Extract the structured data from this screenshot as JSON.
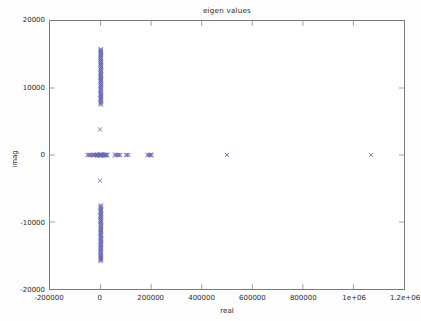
{
  "chart_data": {
    "type": "scatter",
    "title": "eigen values",
    "xlabel": "real",
    "ylabel": "imag",
    "xlim": [
      -200000,
      1200000
    ],
    "ylim": [
      -20000,
      20000
    ],
    "grid": false,
    "legend": null,
    "marker": {
      "symbol": "x",
      "color": "#6a6ab4",
      "size": 4.2
    },
    "xticks": [
      -200000,
      0,
      200000,
      400000,
      600000,
      800000,
      1000000,
      1200000
    ],
    "xticklabels": [
      "-200000",
      "0",
      "200000",
      "400000",
      "600000",
      "800000",
      "1e+06",
      "1.2e+06"
    ],
    "yticks": [
      20000,
      10000,
      0,
      -10000,
      -20000
    ],
    "yticklabels": [
      "20000",
      "10000",
      "0",
      "-10000",
      "-20000"
    ],
    "series": [
      {
        "name": "eigenvalues",
        "points": [
          [
            500,
            15820
          ],
          [
            1400,
            15700
          ],
          [
            -200,
            15600
          ],
          [
            900,
            15480
          ],
          [
            2100,
            15350
          ],
          [
            300,
            15230
          ],
          [
            1700,
            15100
          ],
          [
            -600,
            14980
          ],
          [
            1100,
            14850
          ],
          [
            2400,
            14720
          ],
          [
            0,
            14600
          ],
          [
            800,
            14470
          ],
          [
            1900,
            14350
          ],
          [
            -400,
            14220
          ],
          [
            1300,
            14100
          ],
          [
            600,
            13970
          ],
          [
            2200,
            13840
          ],
          [
            100,
            13720
          ],
          [
            1500,
            13590
          ],
          [
            -300,
            13470
          ],
          [
            1000,
            13340
          ],
          [
            2600,
            13210
          ],
          [
            400,
            13090
          ],
          [
            1800,
            12960
          ],
          [
            -100,
            12830
          ],
          [
            1200,
            12710
          ],
          [
            2300,
            12580
          ],
          [
            700,
            12450
          ],
          [
            1600,
            12330
          ],
          [
            -500,
            12200
          ],
          [
            1100,
            12070
          ],
          [
            2500,
            11950
          ],
          [
            200,
            11820
          ],
          [
            1400,
            11690
          ],
          [
            -200,
            11570
          ],
          [
            900,
            11440
          ],
          [
            2000,
            11310
          ],
          [
            500,
            11190
          ],
          [
            1700,
            11060
          ],
          [
            0,
            10930
          ],
          [
            1300,
            10810
          ],
          [
            2700,
            10680
          ],
          [
            600,
            10550
          ],
          [
            1900,
            10430
          ],
          [
            -400,
            10300
          ],
          [
            1000,
            10170
          ],
          [
            2200,
            10050
          ],
          [
            300,
            9920
          ],
          [
            1500,
            9790
          ],
          [
            -700,
            9670
          ],
          [
            1100,
            9540
          ],
          [
            2400,
            9410
          ],
          [
            400,
            9290
          ],
          [
            1800,
            9160
          ],
          [
            -100,
            9030
          ],
          [
            1200,
            8900
          ],
          [
            2100,
            8780
          ],
          [
            700,
            8650
          ],
          [
            1600,
            8520
          ],
          [
            -500,
            8400
          ],
          [
            1000,
            8270
          ],
          [
            2300,
            8140
          ],
          [
            200,
            8020
          ],
          [
            1400,
            7890
          ],
          [
            -300,
            7760
          ],
          [
            900,
            7640
          ],
          [
            1900,
            7510
          ],
          [
            -1800,
            3820
          ],
          [
            500,
            -15820
          ],
          [
            1400,
            -15700
          ],
          [
            -200,
            -15600
          ],
          [
            900,
            -15480
          ],
          [
            2100,
            -15350
          ],
          [
            300,
            -15230
          ],
          [
            1700,
            -15100
          ],
          [
            -600,
            -14980
          ],
          [
            1100,
            -14850
          ],
          [
            2400,
            -14720
          ],
          [
            0,
            -14600
          ],
          [
            800,
            -14470
          ],
          [
            1900,
            -14350
          ],
          [
            -400,
            -14220
          ],
          [
            1300,
            -14100
          ],
          [
            600,
            -13970
          ],
          [
            2200,
            -13840
          ],
          [
            100,
            -13720
          ],
          [
            1500,
            -13590
          ],
          [
            -300,
            -13470
          ],
          [
            1000,
            -13340
          ],
          [
            2600,
            -13210
          ],
          [
            400,
            -13090
          ],
          [
            1800,
            -12960
          ],
          [
            -100,
            -12830
          ],
          [
            1200,
            -12710
          ],
          [
            2300,
            -12580
          ],
          [
            700,
            -12450
          ],
          [
            1600,
            -12330
          ],
          [
            -500,
            -12200
          ],
          [
            1100,
            -12070
          ],
          [
            2500,
            -11950
          ],
          [
            200,
            -11820
          ],
          [
            1400,
            -11690
          ],
          [
            -200,
            -11570
          ],
          [
            900,
            -11440
          ],
          [
            2000,
            -11310
          ],
          [
            500,
            -11190
          ],
          [
            1700,
            -11060
          ],
          [
            0,
            -10930
          ],
          [
            1300,
            -10810
          ],
          [
            2700,
            -10680
          ],
          [
            600,
            -10550
          ],
          [
            1900,
            -10430
          ],
          [
            -400,
            -10300
          ],
          [
            1000,
            -10170
          ],
          [
            2200,
            -10050
          ],
          [
            300,
            -9920
          ],
          [
            1500,
            -9790
          ],
          [
            -700,
            -9670
          ],
          [
            1100,
            -9540
          ],
          [
            2400,
            -9410
          ],
          [
            400,
            -9290
          ],
          [
            1800,
            -9160
          ],
          [
            -100,
            -9030
          ],
          [
            1200,
            -8900
          ],
          [
            2100,
            -8780
          ],
          [
            700,
            -8650
          ],
          [
            1600,
            -8520
          ],
          [
            -500,
            -8400
          ],
          [
            1000,
            -8270
          ],
          [
            2300,
            -8140
          ],
          [
            200,
            -8020
          ],
          [
            1400,
            -7890
          ],
          [
            -300,
            -7760
          ],
          [
            900,
            -7640
          ],
          [
            1900,
            -7510
          ],
          [
            -1800,
            -3820
          ],
          [
            -52000,
            0
          ],
          [
            -48000,
            0
          ],
          [
            -44000,
            0
          ],
          [
            -40000,
            0
          ],
          [
            -36000,
            0
          ],
          [
            -32000,
            0
          ],
          [
            -28000,
            0
          ],
          [
            -25000,
            0
          ],
          [
            -22000,
            0
          ],
          [
            -19000,
            0
          ],
          [
            -16000,
            0
          ],
          [
            -14000,
            0
          ],
          [
            -12000,
            0
          ],
          [
            -10000,
            0
          ],
          [
            -8500,
            0
          ],
          [
            -7000,
            0
          ],
          [
            -5800,
            0
          ],
          [
            -4600,
            0
          ],
          [
            -3600,
            0
          ],
          [
            -2800,
            0
          ],
          [
            -2000,
            0
          ],
          [
            -1400,
            0
          ],
          [
            -900,
            0
          ],
          [
            -500,
            0
          ],
          [
            -200,
            0
          ],
          [
            0,
            0
          ],
          [
            300,
            0
          ],
          [
            700,
            0
          ],
          [
            1200,
            0
          ],
          [
            1800,
            0
          ],
          [
            2500,
            0
          ],
          [
            3300,
            0
          ],
          [
            4200,
            0
          ],
          [
            5200,
            0
          ],
          [
            6300,
            0
          ],
          [
            7500,
            0
          ],
          [
            8800,
            0
          ],
          [
            10200,
            0
          ],
          [
            11700,
            0
          ],
          [
            13300,
            0
          ],
          [
            15000,
            0
          ],
          [
            16800,
            0
          ],
          [
            18700,
            0
          ],
          [
            20700,
            0
          ],
          [
            22800,
            0
          ],
          [
            25000,
            0
          ],
          [
            27000,
            0
          ],
          [
            55000,
            0
          ],
          [
            60000,
            0
          ],
          [
            64000,
            0
          ],
          [
            69000,
            0
          ],
          [
            74000,
            0
          ],
          [
            78000,
            0
          ],
          [
            100000,
            0
          ],
          [
            105000,
            0
          ],
          [
            110000,
            0
          ],
          [
            185000,
            0
          ],
          [
            190000,
            0
          ],
          [
            193000,
            0
          ],
          [
            196000,
            0
          ],
          [
            199000,
            0
          ],
          [
            202000,
            0
          ],
          [
            500000,
            0
          ],
          [
            1070000,
            0
          ]
        ]
      }
    ]
  },
  "axes": {
    "title": "eigen values",
    "xlabel": "real",
    "ylabel": "imag"
  }
}
